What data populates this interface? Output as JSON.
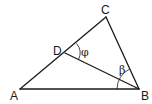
{
  "diagram": {
    "type": "triangle-geometry",
    "points": {
      "A": {
        "label": "A",
        "x": 20,
        "y": 89
      },
      "B": {
        "label": "B",
        "x": 139,
        "y": 89
      },
      "C": {
        "label": "C",
        "x": 106,
        "y": 17
      },
      "D": {
        "label": "D",
        "x": 65,
        "y": 53
      }
    },
    "segments": [
      "AB",
      "BC",
      "CA",
      "DB"
    ],
    "angles": [
      {
        "label": "φ",
        "vertex": "D",
        "between": [
          "C",
          "B"
        ]
      },
      {
        "label": "β",
        "vertex": "B",
        "between": [
          "A",
          "C"
        ]
      }
    ]
  },
  "labels": {
    "A": "A",
    "B": "B",
    "C": "C",
    "D": "D",
    "phi": "φ",
    "beta": "β"
  }
}
